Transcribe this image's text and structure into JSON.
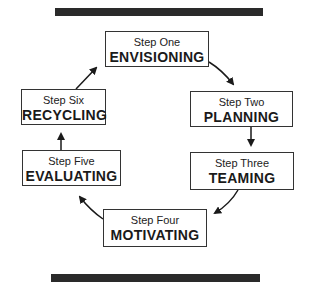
{
  "diagram": {
    "type": "cycle",
    "steps": [
      {
        "number": "Step One",
        "name": "ENVISIONING"
      },
      {
        "number": "Step Two",
        "name": "PLANNING"
      },
      {
        "number": "Step Three",
        "name": "TEAMING"
      },
      {
        "number": "Step Four",
        "name": "MOTIVATING"
      },
      {
        "number": "Step Five",
        "name": "EVALUATING"
      },
      {
        "number": "Step Six",
        "name": "RECYCLING"
      }
    ],
    "flow": [
      "ENVISIONING",
      "PLANNING",
      "TEAMING",
      "MOTIVATING",
      "EVALUATING",
      "RECYCLING",
      "ENVISIONING"
    ],
    "colors": {
      "bar": "#2a2a2a",
      "border": "#333333",
      "text": "#1a1a1a"
    }
  }
}
